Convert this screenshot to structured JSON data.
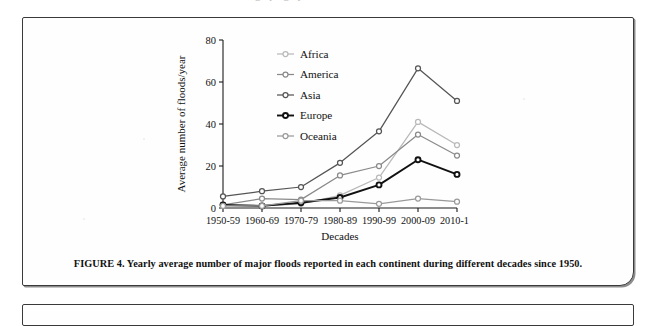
{
  "figure": {
    "caption": "FIGURE 4. Yearly average number of major floods reported in each continent during different decades since 1950."
  },
  "chart_data": {
    "type": "line",
    "title": "",
    "xlabel": "Decades",
    "ylabel": "Average number of floods/year",
    "categories": [
      "1950-59",
      "1960-69",
      "1970-79",
      "1980-89",
      "1990-99",
      "2000-09",
      "2010-15"
    ],
    "ylim": [
      0,
      80
    ],
    "yticks": [
      0,
      20,
      40,
      60,
      80
    ],
    "ytick_labels": [
      "0",
      "20",
      "40",
      "60",
      "80"
    ],
    "grid": false,
    "legend_position": "upper-left-inside",
    "marker": "open-circle",
    "series": [
      {
        "name": "Africa",
        "color": "#b9b9b9",
        "values": [
          1,
          1,
          2,
          6,
          14.5,
          41,
          30
        ]
      },
      {
        "name": "America",
        "color": "#8a8a8a",
        "values": [
          1.5,
          4.5,
          4,
          15.5,
          20,
          35,
          25
        ]
      },
      {
        "name": "Asia",
        "color": "#555555",
        "values": [
          5.5,
          8,
          10,
          21.5,
          36.5,
          66.5,
          51
        ]
      },
      {
        "name": "Europe",
        "color": "#111111",
        "values": [
          1.5,
          1,
          2.5,
          5,
          11,
          23,
          16
        ]
      },
      {
        "name": "Oceania",
        "color": "#9a9a9a",
        "values": [
          1,
          1,
          3.5,
          3.5,
          2,
          4.5,
          3
        ]
      }
    ]
  }
}
